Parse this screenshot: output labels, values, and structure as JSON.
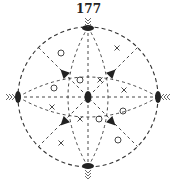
{
  "page_number": "177",
  "diagram": {
    "type": "stereographic-projection",
    "center": [
      88,
      97
    ],
    "radius": 70,
    "line_color": "#333333",
    "symbol_color": "#333333",
    "poles": {
      "axis_glyph": "lens",
      "positions": [
        "top",
        "bottom",
        "left",
        "right",
        "center"
      ]
    },
    "triangles": [
      {
        "x": 64,
        "y": 73,
        "rot": -45
      },
      {
        "x": 112,
        "y": 73,
        "rot": 45
      },
      {
        "x": 64,
        "y": 122,
        "rot": -135
      },
      {
        "x": 112,
        "y": 122,
        "rot": 135
      }
    ],
    "circles": [
      {
        "x": 61,
        "y": 53
      },
      {
        "x": 80,
        "y": 80
      },
      {
        "x": 54,
        "y": 88
      },
      {
        "x": 99,
        "y": 119
      },
      {
        "x": 123,
        "y": 111
      },
      {
        "x": 118,
        "y": 140
      }
    ],
    "crosses": [
      {
        "x": 117,
        "y": 48
      },
      {
        "x": 100,
        "y": 80
      },
      {
        "x": 124,
        "y": 90
      },
      {
        "x": 52,
        "y": 107
      },
      {
        "x": 80,
        "y": 119
      },
      {
        "x": 61,
        "y": 143
      }
    ]
  }
}
